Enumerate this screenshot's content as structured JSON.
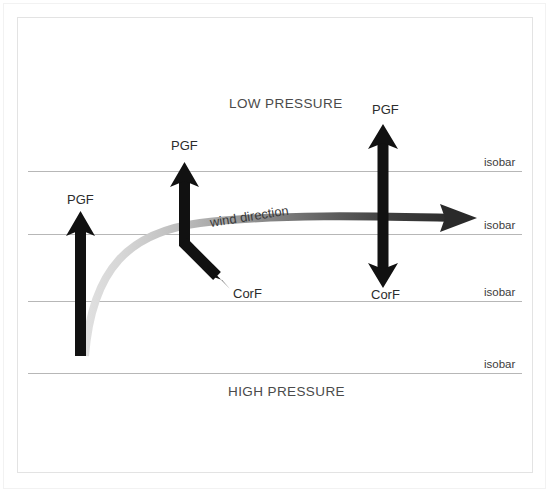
{
  "figure": {
    "type": "diagram",
    "background_color": "#ffffff",
    "frame": {
      "outer_border_color": "#f2f2f2",
      "inner_border_color": "#e3e3e3"
    }
  },
  "pressure_labels": {
    "low": "LOW PRESSURE",
    "high": "HIGH PRESSURE"
  },
  "isobars": {
    "label": "isobar",
    "color": "#b7b7b7",
    "count": 4,
    "y_positions": [
      171,
      234,
      301,
      373
    ],
    "x_start": 28,
    "x_end": 522,
    "labels": [
      "isobar",
      "isobar",
      "isobar",
      "isobar"
    ]
  },
  "wind": {
    "label": "wind direction",
    "curve_color_start": "#dcdcdc",
    "curve_color_end": "#333333",
    "rotation_deg": -9
  },
  "vectors": [
    {
      "id": "left-pgf",
      "label": "PGF",
      "kind": "single-arrow",
      "direction": "up",
      "color": "#111111",
      "x": 81,
      "tail_y": 355,
      "tip_y": 211,
      "label_x": 67,
      "label_y": 194
    },
    {
      "id": "middle-pgf",
      "label": "PGF",
      "kind": "single-arrow",
      "direction": "up",
      "color": "#111111",
      "x": 184,
      "tail_y": 245,
      "tip_y": 162,
      "label_x": 171,
      "label_y": 144
    },
    {
      "id": "middle-corf",
      "label": "CorF",
      "kind": "single-arrow",
      "direction": "down-right",
      "color": "#111111",
      "tail_x": 184,
      "tail_y": 243,
      "tip_x": 228,
      "tip_y": 287,
      "label_x": 232,
      "label_y": 288
    },
    {
      "id": "right-pgf-corf",
      "label_top": "PGF",
      "label_bottom": "CorF",
      "kind": "double-arrow",
      "direction": "vertical",
      "color": "#111111",
      "x": 383,
      "tip_top_y": 124,
      "tip_bottom_y": 288,
      "label_top_x": 372,
      "label_top_y": 106,
      "label_bottom_x": 371,
      "label_bottom_y": 291
    },
    {
      "id": "wind-arrow",
      "label": "wind direction",
      "kind": "curved-arrow",
      "direction": "right",
      "tail_x": 85,
      "tail_y": 355,
      "tip_x": 477,
      "tip_y": 218,
      "label_x": 212,
      "label_y": 218
    }
  ]
}
